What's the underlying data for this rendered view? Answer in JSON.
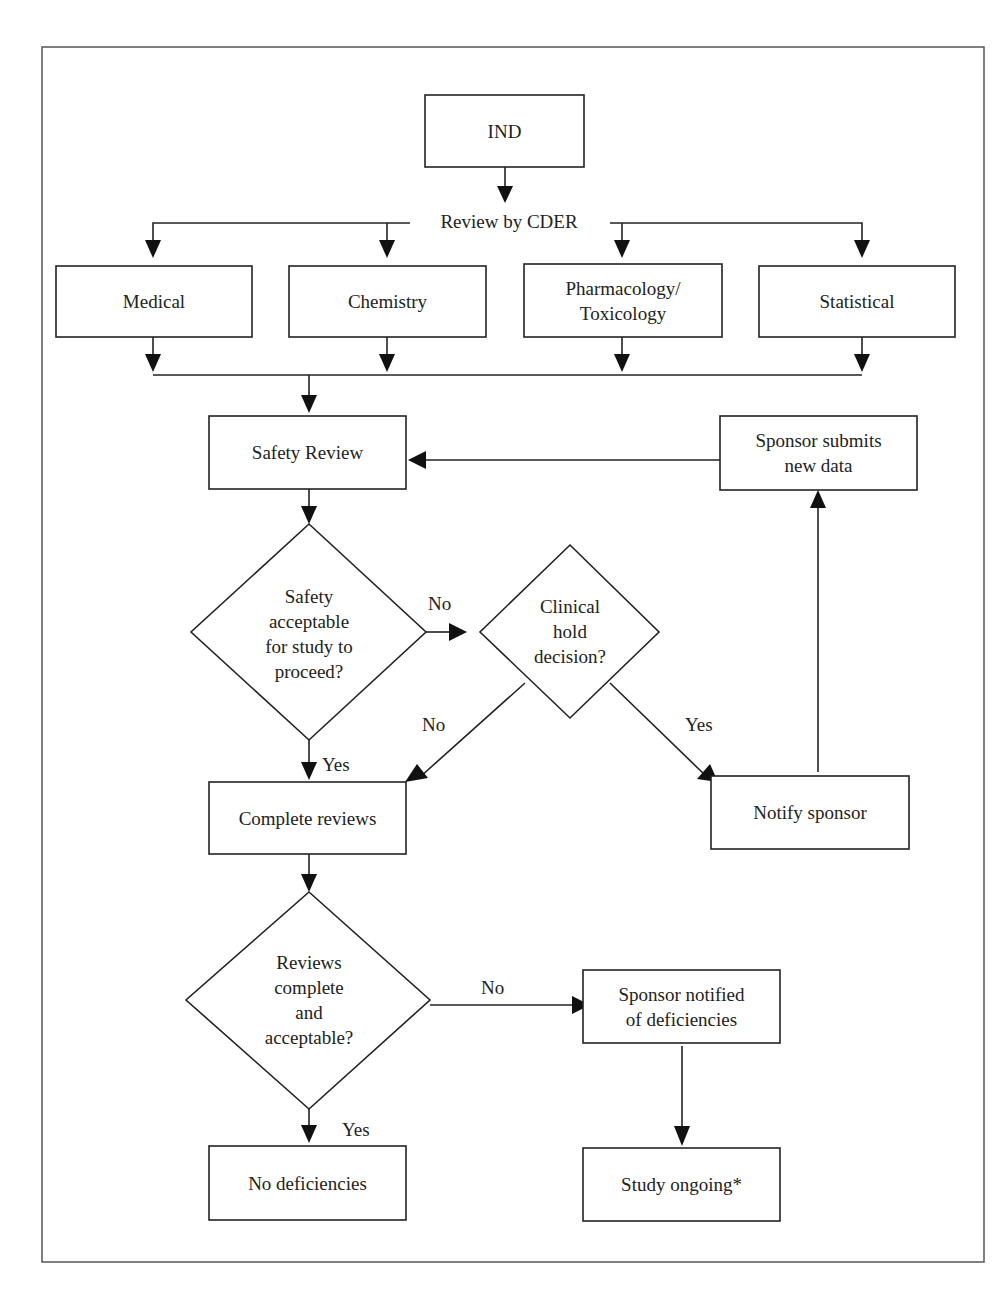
{
  "diagram": {
    "nodes": {
      "ind": "IND",
      "review_by_cder": "Review by CDER",
      "medical": "Medical",
      "chemistry": "Chemistry",
      "pharm_tox": [
        "Pharmacology/",
        "Toxicology"
      ],
      "statistical": "Statistical",
      "safety_review": "Safety Review",
      "sponsor_submits": [
        "Sponsor submits",
        "new data"
      ],
      "safety_decision": [
        "Safety",
        "acceptable",
        "for study to",
        "proceed?"
      ],
      "clinical_hold": [
        "Clinical",
        "hold",
        "decision?"
      ],
      "complete_reviews": "Complete reviews",
      "notify_sponsor": "Notify sponsor",
      "reviews_decision": [
        "Reviews",
        "complete",
        "and",
        "acceptable?"
      ],
      "sponsor_notified": [
        "Sponsor notified",
        "of deficiencies"
      ],
      "no_deficiencies": "No deficiencies",
      "study_ongoing": "Study ongoing*"
    },
    "edge_labels": {
      "safety_no": "No",
      "safety_yes": "Yes",
      "hold_no": "No",
      "hold_yes": "Yes",
      "reviews_no": "No",
      "reviews_yes": "Yes"
    }
  }
}
